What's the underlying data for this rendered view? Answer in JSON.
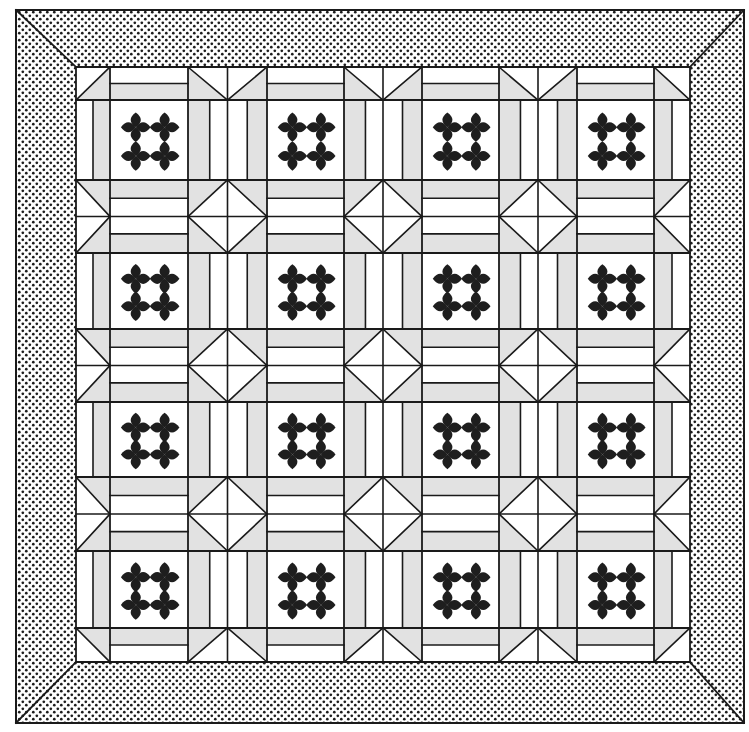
{
  "colors": {
    "background": "#ffffff",
    "line": "#1a1a1a",
    "light_fabric": "#ffffff",
    "shaded_fabric": "#e2e2e2",
    "applique": "#1e1e1e",
    "border_dot": "#1c1c1c"
  },
  "frame": {
    "outer": {
      "x0": 16,
      "y0": 10,
      "x1": 744,
      "y1": 723
    },
    "inner": {
      "x0": 76,
      "y0": 67,
      "x1": 690,
      "y1": 662
    },
    "border_style": "stippled-dots",
    "mitered_corners": true
  },
  "grid": {
    "columns": [
      76,
      110,
      188,
      267,
      344,
      422,
      499,
      577,
      654,
      690
    ],
    "rows": [
      67,
      100,
      180,
      253,
      329,
      402,
      477,
      551,
      628,
      662
    ],
    "cell_kinds_note": "even index = sashing band, odd index = appliqué block"
  },
  "blocks": {
    "count_across": 4,
    "count_down": 4,
    "motif": "four-petal-cross clusters (2x2 per block)",
    "petals_per_block": 4
  },
  "sashing": {
    "stripe_pattern": [
      "shaded",
      "light",
      "light",
      "shaded"
    ],
    "intersection_motif": "diamond-in-square with cross",
    "edge_motif": "half-square triangles",
    "corner_motif": "diagonal split triangle"
  }
}
